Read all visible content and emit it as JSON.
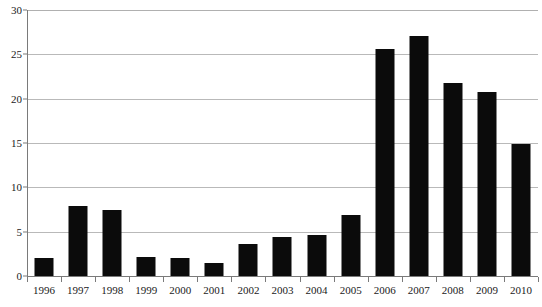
{
  "chart_data": {
    "type": "bar",
    "title": "",
    "subtitle": "",
    "xlabel": "",
    "ylabel": "",
    "categories": [
      "1996",
      "1997",
      "1998",
      "1999",
      "2000",
      "2001",
      "2002",
      "2003",
      "2004",
      "2005",
      "2006",
      "2007",
      "2008",
      "2009",
      "2010"
    ],
    "values": [
      2.0,
      7.9,
      7.5,
      2.1,
      2.0,
      1.5,
      3.6,
      4.4,
      4.6,
      6.9,
      25.6,
      27.1,
      21.8,
      20.7,
      14.9
    ],
    "series": [
      {
        "name": "",
        "values": [
          2.0,
          7.9,
          7.5,
          2.1,
          2.0,
          1.5,
          3.6,
          4.4,
          4.6,
          6.9,
          25.6,
          27.1,
          21.8,
          20.7,
          14.9
        ]
      }
    ],
    "ylim": [
      0,
      30
    ],
    "y_ticks": [
      0,
      5,
      10,
      15,
      20,
      25,
      30
    ],
    "y_tick_labels": [
      "0",
      "5",
      "10",
      "15",
      "20",
      "25",
      "30"
    ],
    "grid": true,
    "grid_axis": "y",
    "legend": false,
    "legend_position": "none",
    "annotations": [],
    "colors": {
      "bar": "#0b0b0b",
      "gridline": "#b9b9b9",
      "axis": "#7a7a7a",
      "text": "#1a1a1a",
      "background": "#ffffff"
    }
  }
}
